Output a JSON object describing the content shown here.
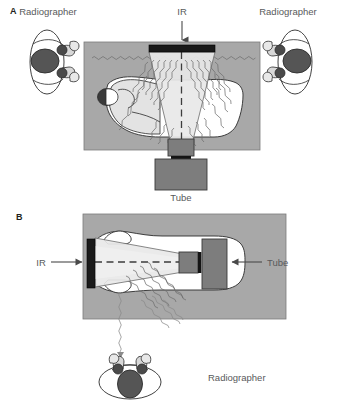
{
  "figure": {
    "width": 339,
    "height": 413,
    "background_color": "#ffffff"
  },
  "colors": {
    "room_fill": "#a8a8a8",
    "room_stroke": "#6e6e6e",
    "body_fill": "#ffffff",
    "body_stroke": "#2b2b2b",
    "beam_fill": "#dcdcdc",
    "beam_stroke": "#555555",
    "ir_fill": "#1a1a1a",
    "tube_fill": "#7d7d7d",
    "tube_stroke": "#3a3a3a",
    "head_fill": "#4f4f4f",
    "scatter_stroke": "#707070",
    "text_color": "#58595b",
    "label_color": "#231f20",
    "gown_fill": "#e6e6e6"
  },
  "panels": [
    {
      "id": "panel-a",
      "label": "A",
      "label_x": 10,
      "label_y": 14,
      "description": "Overhead view of a patient on a bed with vertical x-ray beam; two radiographers stand at either side outside the room.",
      "room": {
        "x": 84,
        "y": 42,
        "width": 176,
        "height": 108
      },
      "annotations": [
        {
          "name": "ir-label",
          "text": "IR",
          "x": 179,
          "y": 16,
          "arrow": {
            "from_x": 182,
            "from_y": 22,
            "to_x": 182,
            "to_y": 44,
            "direction": "down"
          }
        },
        {
          "name": "tube-label",
          "text": "Tube",
          "x": 172,
          "y": 196,
          "arrow": null
        },
        {
          "name": "radiographer-left-label",
          "text": "Radiographer",
          "x": 48,
          "y": 14,
          "arrow": null
        },
        {
          "name": "radiographer-right-label",
          "text": "Radiographer",
          "x": 288,
          "y": 14,
          "arrow": null
        }
      ],
      "components": [
        {
          "name": "image-receptor",
          "label": "IR",
          "shape": "dark-bar",
          "x": 149,
          "y": 45,
          "width": 66,
          "height": 7
        },
        {
          "name": "x-ray-tube-collimator",
          "shape": "box",
          "x": 168,
          "y": 140,
          "width": 24,
          "height": 16
        },
        {
          "name": "x-ray-tube-housing",
          "shape": "box",
          "x": 155,
          "y": 159,
          "width": 52,
          "height": 30
        },
        {
          "name": "central-ray",
          "shape": "dashed-line",
          "from_x": 181,
          "from_y": 52,
          "to_x": 181,
          "to_y": 142
        },
        {
          "name": "patient",
          "shape": "supine-body",
          "head_x": 107,
          "head_y": 97
        }
      ],
      "radiographers": [
        {
          "name": "radiographer-left",
          "x": 48,
          "y": 62,
          "facing": "right"
        },
        {
          "name": "radiographer-right",
          "x": 297,
          "y": 62,
          "facing": "left"
        }
      ],
      "scatter_label": "scatter radiation"
    },
    {
      "id": "panel-b",
      "label": "B",
      "label_x": 16,
      "label_y": 219,
      "description": "Overhead view of a horizontal-beam projection; the radiographer stands perpendicular, out of the scatter path.",
      "room": {
        "x": 83,
        "y": 214,
        "width": 203,
        "height": 105
      },
      "annotations": [
        {
          "name": "ir-label",
          "text": "IR",
          "x": 44,
          "y": 265,
          "arrow": {
            "from_x": 54,
            "from_y": 262,
            "to_x": 85,
            "to_y": 262,
            "direction": "right"
          }
        },
        {
          "name": "tube-label",
          "text": "Tube",
          "x": 269,
          "y": 265,
          "arrow": {
            "from_x": 262,
            "from_y": 262,
            "to_x": 233,
            "to_y": 262,
            "direction": "left"
          }
        },
        {
          "name": "radiographer-label",
          "text": "Radiographer",
          "x": 208,
          "y": 380,
          "arrow": null
        }
      ],
      "components": [
        {
          "name": "image-receptor",
          "label": "IR",
          "shape": "dark-bar",
          "x": 87,
          "y": 240,
          "width": 8,
          "height": 47
        },
        {
          "name": "x-ray-tube-collimator",
          "shape": "box",
          "x": 180,
          "y": 253,
          "width": 18,
          "height": 20
        },
        {
          "name": "x-ray-tube-housing",
          "shape": "box",
          "x": 202,
          "y": 240,
          "width": 25,
          "height": 48
        },
        {
          "name": "central-ray",
          "shape": "dashed-line",
          "from_x": 95,
          "from_y": 262,
          "to_x": 180,
          "to_y": 262
        },
        {
          "name": "patient",
          "shape": "supine-body-lateral",
          "head_x": 120,
          "head_y": 262
        }
      ],
      "radiographers": [
        {
          "name": "radiographer-bottom",
          "x": 130,
          "y": 378,
          "facing": "up"
        }
      ],
      "scatter_label": "scatter radiation"
    }
  ],
  "legend_terms": {
    "ir": "IR",
    "tube": "Tube",
    "radiographer": "Radiographer"
  }
}
